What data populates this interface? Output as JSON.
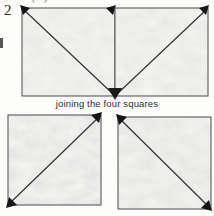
{
  "figure": {
    "number": "2",
    "caption": "joining the four squares",
    "margin_glyph_top": "partial-circle-glyph",
    "margin_glyph_left": "partial-letter-glyph"
  },
  "style": {
    "outline_color": "#555555",
    "diagonal_color": "#3b3b3b",
    "corner_mark_color": "#1e1e1e",
    "fabric_fill": "#f3f3f1",
    "paper_color": "#fdfdfc",
    "text_color": "#2e2e2e"
  },
  "diagram": {
    "type": "four-squares-with-diagonals",
    "top_row_label": "top row of two joined squares",
    "bottom_row_label": "bottom row of two separate squares",
    "squares": [
      {
        "id": "top-left",
        "position": "top-left",
        "x": 22,
        "y": 8,
        "width": 93,
        "height": 88,
        "diagonal": "top-left-to-bottom-right",
        "corner_marks": [
          "top-left",
          "top-right",
          "bottom-right"
        ],
        "joined": true
      },
      {
        "id": "top-right",
        "position": "top-right",
        "x": 115,
        "y": 8,
        "width": 93,
        "height": 88,
        "diagonal": "bottom-left-to-top-right",
        "corner_marks": [
          "top-right",
          "bottom-left"
        ],
        "joined": true
      },
      {
        "id": "bottom-left",
        "position": "bottom-left",
        "x": 8,
        "y": 115,
        "width": 93,
        "height": 90,
        "diagonal": "bottom-left-to-top-right",
        "corner_marks": [
          "top-right",
          "bottom-left"
        ],
        "joined": false
      },
      {
        "id": "bottom-right",
        "position": "bottom-right",
        "x": 118,
        "y": 117,
        "width": 93,
        "height": 92,
        "diagonal": "top-left-to-bottom-right",
        "corner_marks": [
          "top-left",
          "bottom-right"
        ],
        "joined": false
      }
    ]
  }
}
